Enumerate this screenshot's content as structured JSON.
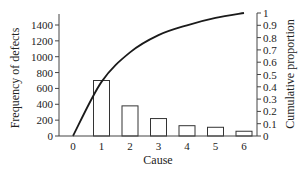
{
  "chart_data": {
    "type": "bar",
    "title": "",
    "xlabel": "Cause",
    "ylabel": "Frequency of defects",
    "y2label": "Cumulative proportion",
    "categories": [
      "1",
      "2",
      "3",
      "4",
      "5",
      "6"
    ],
    "x_ticks": [
      "0",
      "1",
      "2",
      "3",
      "4",
      "5",
      "6"
    ],
    "series": [
      {
        "name": "Frequency of defects",
        "type": "bar",
        "axis": "left",
        "values": [
          700,
          380,
          220,
          130,
          110,
          60
        ]
      },
      {
        "name": "Cumulative proportion",
        "type": "line",
        "axis": "right",
        "x": [
          0,
          1,
          2,
          3,
          4,
          5,
          6
        ],
        "values": [
          0,
          0.44,
          0.68,
          0.82,
          0.9,
          0.96,
          1.0
        ]
      }
    ],
    "ylim": [
      0,
      1400
    ],
    "y_ticks": [
      "0",
      "200",
      "400",
      "600",
      "800",
      "1000",
      "1200",
      "1400"
    ],
    "y2lim": [
      0,
      1
    ],
    "y2_ticks": [
      "0",
      "0.1",
      "0.2",
      "0.3",
      "0.4",
      "0.5",
      "0.6",
      "0.7",
      "0.8",
      "0.9",
      "1"
    ],
    "grid": false,
    "legend": "none",
    "chart_kind": "Pareto chart"
  }
}
